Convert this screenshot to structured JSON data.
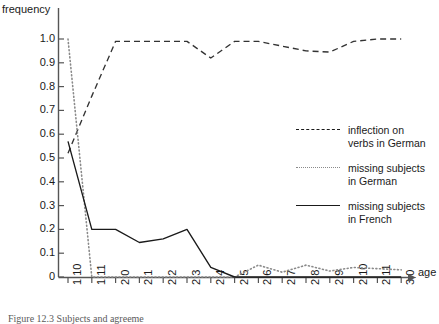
{
  "chart_data": {
    "type": "line",
    "title": "",
    "xlabel": "age",
    "ylabel": "frequency",
    "grid": false,
    "legend_position": "right",
    "ylim": [
      0,
      1.0
    ],
    "ytick_labels": [
      "1.0",
      "0.9",
      "0.8",
      "0.7",
      "0.6",
      "0.5",
      "0.4",
      "0.3",
      "0.2",
      "0.1",
      "0"
    ],
    "ytick_values": [
      1.0,
      0.9,
      0.8,
      0.7,
      0.6,
      0.5,
      0.4,
      0.3,
      0.2,
      0.1,
      0
    ],
    "categories": [
      "1;10",
      "1;11",
      "2;0",
      "2;1",
      "2;2",
      "2;3",
      "2;4",
      "2;5",
      "2;6",
      "2;7",
      "2;8",
      "2;9",
      "2;10",
      "2;11",
      "3;0"
    ],
    "series": [
      {
        "name": "inflection on verbs in German",
        "style": "dashed",
        "color": "#333333",
        "values": [
          0.52,
          0.76,
          0.99,
          0.99,
          0.99,
          0.99,
          0.92,
          0.99,
          0.99,
          0.97,
          0.95,
          0.945,
          0.99,
          1.0,
          1.0
        ]
      },
      {
        "name": "missing subjects in German",
        "style": "dotted",
        "color": "#8a8a8a",
        "values": [
          1.0,
          0.0,
          0.0,
          0.0,
          0.0,
          0.0,
          0.0,
          0.0,
          0.05,
          0.02,
          0.05,
          0.025,
          0.04,
          0.035,
          0.03
        ]
      },
      {
        "name": "missing subjects in French",
        "style": "solid",
        "color": "#1a1a1a",
        "values": [
          0.57,
          0.2,
          0.2,
          0.145,
          0.16,
          0.2,
          0.04,
          0.0,
          0.0,
          0.0,
          0.0,
          0.0,
          0.0,
          0.0,
          0.0
        ]
      }
    ]
  },
  "legend": {
    "entries": [
      {
        "style": "dashed",
        "line1": "inflection on",
        "line2": "verbs in German"
      },
      {
        "style": "dotted",
        "line1": "missing subjects",
        "line2": "in German"
      },
      {
        "style": "solid",
        "line1": "missing subjects",
        "line2": "in French"
      }
    ]
  },
  "caption": "Figure 12.3  Subjects and agreeme"
}
